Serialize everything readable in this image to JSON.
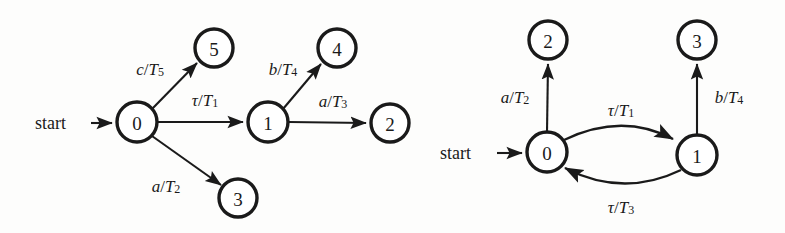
{
  "figure": {
    "stroke_color": "#1a1a1a",
    "background_color": "#fdfdfc"
  },
  "diagrams": [
    {
      "id": "left",
      "start_label": "start",
      "nodes": [
        {
          "id": "n0",
          "label": "0",
          "cx": 137,
          "cy": 122,
          "r": 20
        },
        {
          "id": "n5",
          "label": "5",
          "cx": 214,
          "cy": 48,
          "r": 19
        },
        {
          "id": "n3",
          "label": "3",
          "cx": 238,
          "cy": 198,
          "r": 19
        },
        {
          "id": "n1",
          "label": "1",
          "cx": 268,
          "cy": 122,
          "r": 20
        },
        {
          "id": "n4",
          "label": "4",
          "cx": 337,
          "cy": 48,
          "r": 19
        },
        {
          "id": "n2",
          "label": "2",
          "cx": 390,
          "cy": 123,
          "r": 19
        }
      ],
      "edges": [
        {
          "from": "n0",
          "to": "n5",
          "action": "c",
          "sep": "/",
          "clock": "T",
          "sub": "5",
          "label_x": 150,
          "label_y": 69
        },
        {
          "from": "n0",
          "to": "n1",
          "action": "τ",
          "sep": "/",
          "clock": "T",
          "sub": "1",
          "label_x": 205,
          "label_y": 100
        },
        {
          "from": "n0",
          "to": "n3",
          "action": "a",
          "sep": "/",
          "clock": "T",
          "sub": "2",
          "label_x": 166,
          "label_y": 186
        },
        {
          "from": "n1",
          "to": "n4",
          "action": "b",
          "sep": "/",
          "clock": "T",
          "sub": "4",
          "label_x": 283,
          "label_y": 69
        },
        {
          "from": "n1",
          "to": "n2",
          "action": "a",
          "sep": "/",
          "clock": "T",
          "sub": "3",
          "label_x": 333,
          "label_y": 101
        }
      ]
    },
    {
      "id": "right",
      "start_label": "start",
      "nodes": [
        {
          "id": "n2",
          "label": "2",
          "cx": 548,
          "cy": 40,
          "r": 19
        },
        {
          "id": "n3",
          "label": "3",
          "cx": 697,
          "cy": 40,
          "r": 19
        },
        {
          "id": "n0",
          "label": "0",
          "cx": 547,
          "cy": 152,
          "r": 20
        },
        {
          "id": "n1",
          "label": "1",
          "cx": 697,
          "cy": 155,
          "r": 20
        }
      ],
      "edges": [
        {
          "from": "n0",
          "to": "n2",
          "action": "a",
          "sep": "/",
          "clock": "T",
          "sub": "2",
          "label_x": 515,
          "label_y": 97
        },
        {
          "from": "n1",
          "to": "n3",
          "action": "b",
          "sep": "/",
          "clock": "T",
          "sub": "4",
          "label_x": 729,
          "label_y": 97
        },
        {
          "from": "n0",
          "to": "n1",
          "action": "τ",
          "sep": "/",
          "clock": "T",
          "sub": "1",
          "label_x": 621,
          "label_y": 110,
          "curve": "upper"
        },
        {
          "from": "n1",
          "to": "n0",
          "action": "τ",
          "sep": "/",
          "clock": "T",
          "sub": "3",
          "label_x": 621,
          "label_y": 207,
          "curve": "lower"
        }
      ]
    }
  ],
  "icons": {
    "arrowhead": "solid-triangle-arrowhead"
  }
}
